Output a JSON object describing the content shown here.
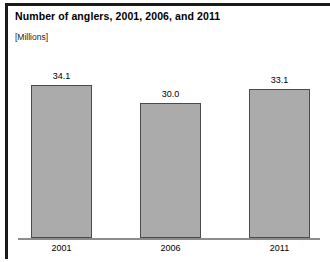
{
  "chart_data": {
    "type": "bar",
    "title": "Number of anglers, 2001, 2006, and 2011",
    "subtitle": "[Millions]",
    "xlabel": "",
    "ylabel": "",
    "categories": [
      "2001",
      "2006",
      "2011"
    ],
    "values": [
      34.1,
      30.0,
      33.1
    ],
    "value_labels": [
      "34.1",
      "30.0",
      "33.1"
    ],
    "ylim": [
      0,
      38
    ],
    "grid": false,
    "legend": false,
    "bar_color": "#ababab",
    "bar_border_color": "#4a4a4a",
    "axis_color": "#8c8c8c",
    "frame_color": "#1b1b1b"
  }
}
